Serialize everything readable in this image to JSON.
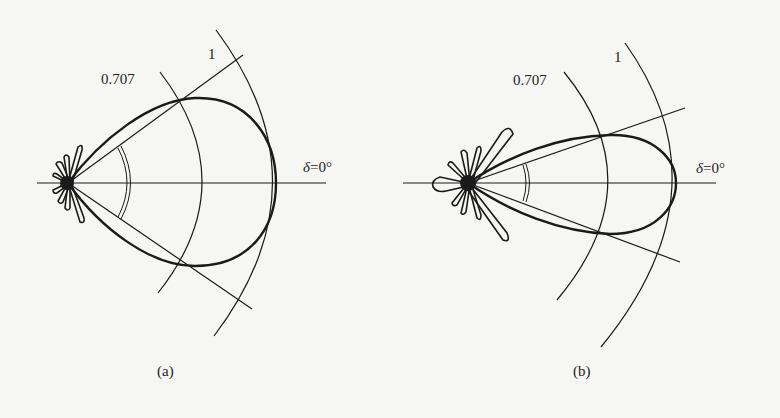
{
  "figure_a": {
    "caption": "(a)",
    "label_half_power": "0.707",
    "label_unit": "1",
    "label_axis_symbol": "δ",
    "label_axis_value": "=0°"
  },
  "figure_b": {
    "caption": "(b)",
    "label_half_power": "0.707",
    "label_unit": "1",
    "label_axis_symbol": "δ",
    "label_axis_value": "=0°"
  },
  "colors": {
    "ink": "#1a1a1a",
    "background": "#f6f6f4"
  }
}
